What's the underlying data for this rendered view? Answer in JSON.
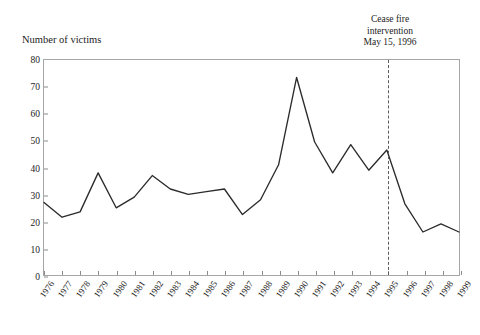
{
  "annotation": {
    "line1": "Cease fire",
    "line2": "intervention",
    "line3": "May 15, 1996"
  },
  "axis": {
    "y_title": "Number of victims"
  },
  "colors": {
    "line": "#2b2b2b",
    "frame": "#a6a6a6",
    "event_line": "#5a5a5a",
    "text": "#1b1b1b",
    "background": "#ffffff"
  },
  "chart_data": {
    "type": "line",
    "title": "",
    "xlabel": "",
    "ylabel": "Number of victims",
    "ylim": [
      0,
      80
    ],
    "ytick_step": 10,
    "yticks": [
      0,
      10,
      20,
      30,
      40,
      50,
      60,
      70,
      80
    ],
    "grid": false,
    "legend": "none",
    "categories": [
      "1976",
      "1977",
      "1978",
      "1979",
      "1980",
      "1981",
      "1982",
      "1983",
      "1984",
      "1985",
      "1986",
      "1987",
      "1988",
      "1989",
      "1990",
      "1991",
      "1992",
      "1993",
      "1994",
      "1995",
      "1996",
      "1997",
      "1998",
      "1999"
    ],
    "values": [
      27,
      21.5,
      23.5,
      38,
      25,
      29,
      37,
      32,
      30,
      31,
      32,
      22.5,
      28,
      41,
      73.5,
      49.5,
      38,
      48.5,
      39,
      46.5,
      26.5,
      16,
      19,
      16
    ],
    "series": [
      {
        "name": "Number of victims",
        "values": [
          27,
          21.5,
          23.5,
          38,
          25,
          29,
          37,
          32,
          30,
          31,
          32,
          22.5,
          28,
          41,
          73.5,
          49.5,
          38,
          48.5,
          39,
          46.5,
          26.5,
          16,
          19,
          16
        ]
      }
    ],
    "annotations": [
      {
        "text": "Cease fire intervention May 15, 1996",
        "x_category": "1995",
        "style": "dashed-vertical-line"
      }
    ]
  }
}
